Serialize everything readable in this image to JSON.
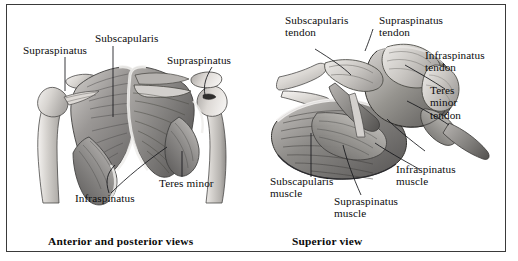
{
  "figure": {
    "background": "#ffffff",
    "border_color": "#3a3a3a"
  },
  "panels": [
    {
      "id": "anterior-posterior",
      "caption": "Anterior and posterior views",
      "labels": [
        {
          "id": "supraspinatus-left",
          "text": "Supraspinatus",
          "lines": [
            "Supraspinatus"
          ]
        },
        {
          "id": "subscapularis",
          "text": "Subscapularis",
          "lines": [
            "Subscapularis"
          ]
        },
        {
          "id": "supraspinatus-right",
          "text": "Supraspinatus",
          "lines": [
            "Supraspinatus"
          ]
        },
        {
          "id": "infraspinatus",
          "text": "Infraspinatus",
          "lines": [
            "Infraspinatus"
          ]
        },
        {
          "id": "teres-minor",
          "text": "Teres minor",
          "lines": [
            "Teres minor"
          ]
        }
      ]
    },
    {
      "id": "superior",
      "caption": "Superior view",
      "labels": [
        {
          "id": "subscapularis-tendon",
          "text": "Subscapularis tendon",
          "lines": [
            "Subscapularis",
            "tendon"
          ]
        },
        {
          "id": "supraspinatus-tendon",
          "text": "Supraspinatus tendon",
          "lines": [
            "Supraspinatus",
            "tendon"
          ]
        },
        {
          "id": "infraspinatus-tendon",
          "text": "Infraspinatus tendon",
          "lines": [
            "Infraspinatus",
            "tendon"
          ]
        },
        {
          "id": "teres-minor-tendon",
          "text": "Teres minor tendon",
          "lines": [
            "Teres",
            "minor",
            "tendon"
          ]
        },
        {
          "id": "subscapularis-muscle",
          "text": "Subscapularis muscle",
          "lines": [
            "Subscapularis",
            "muscle"
          ]
        },
        {
          "id": "supraspinatus-muscle",
          "text": "Supraspinatus muscle",
          "lines": [
            "Supraspinatus",
            "muscle"
          ]
        },
        {
          "id": "infraspinatus-muscle",
          "text": "Infraspinatus muscle",
          "lines": [
            "Infraspinatus",
            "muscle"
          ]
        }
      ]
    }
  ],
  "labels_flat": {
    "ap_supraspinatus_left": "Supraspinatus",
    "ap_subscapularis": "Subscapularis",
    "ap_supraspinatus_right": "Supraspinatus",
    "ap_infraspinatus": "Infraspinatus",
    "ap_teres_minor": "Teres minor",
    "sv_subscapularis_tendon_1": "Subscapularis",
    "sv_subscapularis_tendon_2": "tendon",
    "sv_supraspinatus_tendon_1": "Supraspinatus",
    "sv_supraspinatus_tendon_2": "tendon",
    "sv_infraspinatus_tendon_1": "Infraspinatus",
    "sv_infraspinatus_tendon_2": "tendon",
    "sv_teres_minor_tendon_1": "Teres",
    "sv_teres_minor_tendon_2": "minor",
    "sv_teres_minor_tendon_3": "tendon",
    "sv_subscapularis_muscle_1": "Subscapularis",
    "sv_subscapularis_muscle_2": "muscle",
    "sv_supraspinatus_muscle_1": "Supraspinatus",
    "sv_supraspinatus_muscle_2": "muscle",
    "sv_infraspinatus_muscle_1": "Infraspinatus",
    "sv_infraspinatus_muscle_2": "muscle"
  },
  "captions": {
    "anterior_posterior": "Anterior and posterior views",
    "superior": "Superior view"
  },
  "palette": {
    "bone_light": "#e9e7e4",
    "bone_mid": "#c9c6c2",
    "muscle_light": "#bdbab7",
    "muscle_mid": "#8e8c8a",
    "muscle_dark": "#5e5c5b",
    "outline": "#3b3b3b",
    "leader_line": "#15161a",
    "text": "#0d0d0d"
  }
}
